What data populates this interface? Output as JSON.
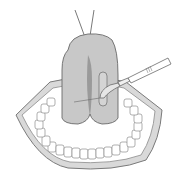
{
  "illustration": {
    "subject": "surgical illustration of tongue incision with scalpel in open mouth",
    "colors": {
      "background": "#ffffff",
      "tongue_fill": "#c9c9c9",
      "tongue_shadow": "#8e8e8e",
      "outline": "#6a6a6a",
      "lip_retractor": "#d6d6d6",
      "teeth_fill": "#ffffff"
    },
    "elements": [
      "suture-threads",
      "tongue",
      "midline-groove",
      "incision-window",
      "scalpel",
      "lip-retractor-ring",
      "upper-teeth",
      "lower-teeth"
    ]
  }
}
